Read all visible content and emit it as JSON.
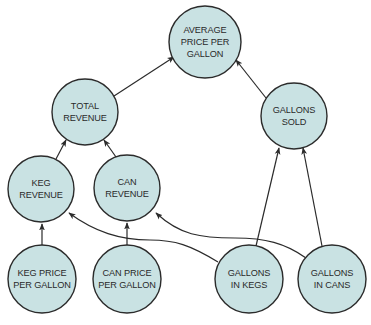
{
  "diagram": {
    "type": "dependency-tree",
    "colors": {
      "node_fill": "#c9e2e3",
      "stroke": "#2b2b2b",
      "text": "#2a2a2a"
    },
    "nodes": [
      {
        "id": "avg",
        "lines": [
          "AVERAGE",
          "PRICE PER",
          "GALLON"
        ],
        "cx": 205,
        "cy": 42
      },
      {
        "id": "total",
        "lines": [
          "TOTAL",
          "REVENUE"
        ],
        "cx": 85,
        "cy": 112
      },
      {
        "id": "sold",
        "lines": [
          "GALLONS",
          "SOLD"
        ],
        "cx": 294,
        "cy": 116
      },
      {
        "id": "kegrev",
        "lines": [
          "KEG",
          "REVENUE"
        ],
        "cx": 41,
        "cy": 189
      },
      {
        "id": "canrev",
        "lines": [
          "CAN",
          "REVENUE"
        ],
        "cx": 127,
        "cy": 188
      },
      {
        "id": "kegprice",
        "lines": [
          "KEG PRICE",
          "PER GALLON"
        ],
        "cx": 42,
        "cy": 279
      },
      {
        "id": "canprice",
        "lines": [
          "CAN PRICE",
          "PER GALLON"
        ],
        "cx": 127,
        "cy": 279
      },
      {
        "id": "kegs",
        "lines": [
          "GALLONS",
          "IN KEGS"
        ],
        "cx": 249,
        "cy": 279
      },
      {
        "id": "cans",
        "lines": [
          "GALLONS",
          "IN CANS"
        ],
        "cx": 332,
        "cy": 279
      }
    ],
    "edges": [
      {
        "from": "total",
        "to": "avg"
      },
      {
        "from": "sold",
        "to": "avg"
      },
      {
        "from": "kegrev",
        "to": "total"
      },
      {
        "from": "canrev",
        "to": "total"
      },
      {
        "from": "kegprice",
        "to": "kegrev"
      },
      {
        "from": "canprice",
        "to": "canrev"
      },
      {
        "from": "kegs",
        "to": "kegrev"
      },
      {
        "from": "cans",
        "to": "canrev"
      },
      {
        "from": "kegs",
        "to": "sold"
      },
      {
        "from": "cans",
        "to": "sold"
      }
    ]
  }
}
